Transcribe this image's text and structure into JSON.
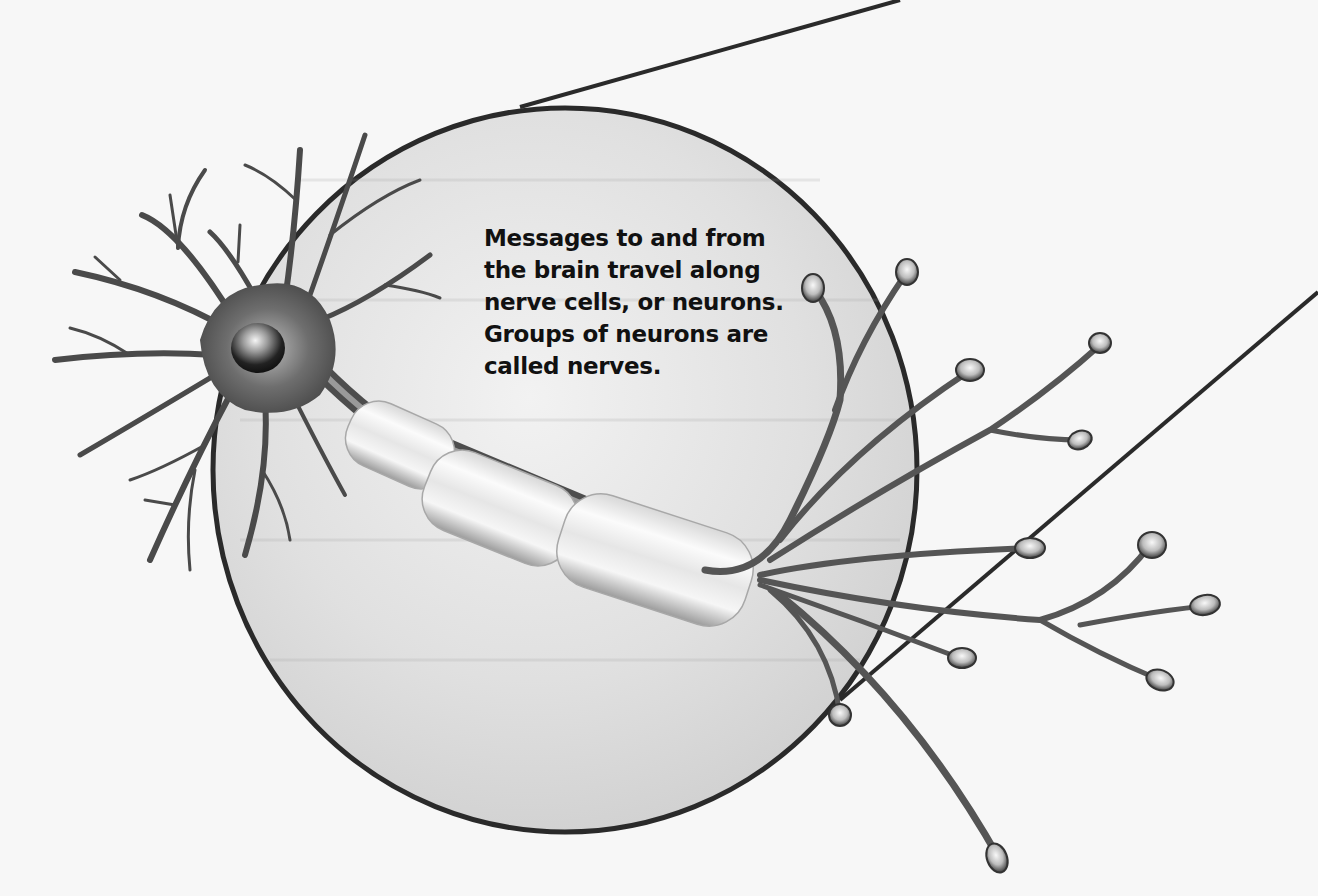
{
  "diagram": {
    "subject": "neuron",
    "caption_lines": [
      "Messages to and from",
      "the brain travel along",
      "nerve cells, or neurons.",
      "Groups of neurons are",
      "called nerves."
    ],
    "parts": [
      {
        "name": "cell-body",
        "label": "cell body with nucleus"
      },
      {
        "name": "dendrites",
        "label": "dendrites"
      },
      {
        "name": "axon",
        "label": "axon with myelin sheath segments"
      },
      {
        "name": "axon-terminals",
        "label": "axon terminals"
      },
      {
        "name": "magnification-circle",
        "label": "magnified view circle"
      }
    ],
    "colors": {
      "background": "#f7f7f7",
      "circle_fill": "#dcdcdc",
      "outline": "#2a2a2a",
      "neuron_dark": "#3a3a3a",
      "neuron_mid": "#8a8a8a",
      "myelin_light": "#f0f0f0",
      "text": "#111111"
    }
  }
}
